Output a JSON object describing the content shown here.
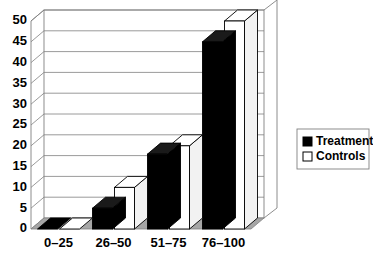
{
  "chart_data": {
    "type": "bar",
    "title": "",
    "subtitle": "",
    "xlabel": "",
    "ylabel": "",
    "categories": [
      "0–25",
      "26–50",
      "51–75",
      "76–100"
    ],
    "series": [
      {
        "name": "Treatment",
        "values": [
          0,
          5,
          18,
          45
        ],
        "color": "#000000"
      },
      {
        "name": "Controls",
        "values": [
          0,
          10,
          20,
          50
        ],
        "color": "#ffffff"
      }
    ],
    "ylim": [
      0,
      50
    ],
    "ytick_step": 5,
    "yticks": [
      "0",
      "5",
      "10",
      "15",
      "20",
      "25",
      "30",
      "35",
      "40",
      "45",
      "50"
    ],
    "grid": true,
    "legend_position": "right",
    "style": "3d-clustered-column"
  },
  "legend": {
    "items": [
      {
        "label": "Treatment",
        "swatch": "filled-black-square"
      },
      {
        "label": "Controls",
        "swatch": "empty-white-square"
      }
    ]
  },
  "colors": {
    "treatment": "#000000",
    "controls": "#ffffff",
    "grid": "#808080",
    "floor": "#a6a6a6",
    "outline": "#000000",
    "background": "#ffffff"
  }
}
